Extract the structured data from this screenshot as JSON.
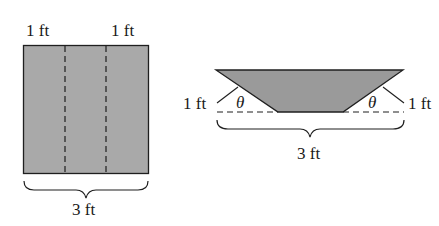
{
  "figure": {
    "colors": {
      "background": "#ffffff",
      "stroke": "#1f1f1f",
      "sheet_fill": "#a9a9a9",
      "gutter_fill": "#9a9a9a"
    },
    "flat_sheet": {
      "top_labels": [
        "1 ft",
        "1 ft"
      ],
      "width_label": "3 ft",
      "fold_lines": 2
    },
    "gutter_cross_section": {
      "side_labels": [
        "1 ft",
        "1 ft"
      ],
      "angle_labels": [
        "θ",
        "θ"
      ],
      "width_label": "3 ft"
    }
  }
}
